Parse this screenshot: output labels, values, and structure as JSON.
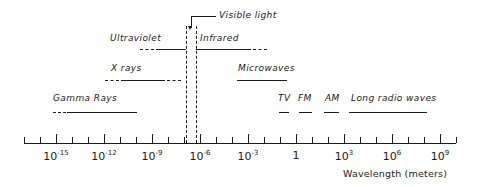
{
  "figure": {
    "axis_title": "Wavelength (meters)",
    "ink_color": "#1a1a1a",
    "background_color": "#ffffff"
  },
  "chart_data": {
    "type": "scatter",
    "xlabel": "Wavelength (meters)",
    "ylabel": "",
    "grid": false,
    "legend": "none",
    "x_scale": "log10",
    "xlim": [
      -17,
      10
    ],
    "axis_ticks": {
      "minor_step_decades": 1,
      "major_step_decades": 3,
      "minor_range": [
        -17,
        10
      ],
      "major_exponents": [
        -15,
        -12,
        -9,
        -6,
        -3,
        0,
        3,
        6,
        9
      ],
      "labels": [
        {
          "exponent": -15,
          "text": "10",
          "superscript": "-15"
        },
        {
          "exponent": -12,
          "text": "10",
          "superscript": "-12"
        },
        {
          "exponent": -9,
          "text": "10",
          "superscript": "-9"
        },
        {
          "exponent": -6,
          "text": "10",
          "superscript": "-6"
        },
        {
          "exponent": -3,
          "text": "10",
          "superscript": "-3"
        },
        {
          "exponent": 0,
          "text": "1",
          "superscript": ""
        },
        {
          "exponent": 3,
          "text": "10",
          "superscript": "3"
        },
        {
          "exponent": 6,
          "text": "10",
          "superscript": "6"
        },
        {
          "exponent": 9,
          "text": "10",
          "superscript": "9"
        }
      ]
    },
    "bands": [
      {
        "name": "Gamma Rays",
        "label": "Gamma Rays",
        "row": 3,
        "solid_start_exp": -15.4,
        "solid_end_exp": -11.3,
        "dash_left": true,
        "dash_right": false
      },
      {
        "name": "X rays",
        "label": "X rays",
        "row": 2,
        "solid_start_exp": -12.2,
        "solid_end_exp": -8.3,
        "dash_left": true,
        "dash_right": true
      },
      {
        "name": "Ultraviolet",
        "label": "Ultraviolet",
        "row": 1,
        "solid_start_exp": -9.1,
        "solid_end_exp": -6.85,
        "dash_left": true,
        "dash_right": false
      },
      {
        "name": "Infrared",
        "label": "Infrared",
        "row": 1,
        "solid_start_exp": -6.5,
        "solid_end_exp": -3.6,
        "dash_left": false,
        "dash_right": true
      },
      {
        "name": "Microwaves",
        "label": "Microwaves",
        "row": 2,
        "solid_start_exp": -3.9,
        "solid_end_exp": -1.3,
        "dash_left": false,
        "dash_right": false
      },
      {
        "name": "TV",
        "label": "TV",
        "row": 3,
        "solid_start_exp": 0.0,
        "solid_end_exp": 0.35,
        "dash_left": false,
        "dash_right": false
      },
      {
        "name": "FM",
        "label": "FM",
        "row": 3,
        "solid_start_exp": 0.75,
        "solid_end_exp": 1.15,
        "dash_left": false,
        "dash_right": false
      },
      {
        "name": "AM",
        "label": "AM",
        "row": 3,
        "solid_start_exp": 2.4,
        "solid_end_exp": 2.95,
        "dash_left": false,
        "dash_right": false
      },
      {
        "name": "Long radio waves",
        "label": "Long radio waves",
        "row": 3,
        "solid_start_exp": 3.5,
        "solid_end_exp": 7.0,
        "dash_left": false,
        "dash_right": false
      }
    ],
    "visible_light": {
      "label": "Visible light",
      "left_boundary_exp": -6.95,
      "right_boundary_exp": -6.35,
      "annotation": "Visible light"
    },
    "annotations": [
      "Gamma Rays",
      "X rays",
      "Ultraviolet",
      "Visible light",
      "Infrared",
      "Microwaves",
      "TV",
      "FM",
      "AM",
      "Long radio waves"
    ]
  }
}
